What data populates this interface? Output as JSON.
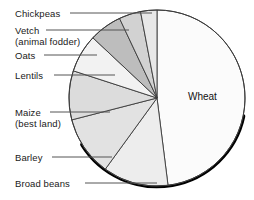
{
  "chart_data": {
    "type": "pie",
    "title": "",
    "subtitle": "",
    "xlabel": "",
    "ylabel": "",
    "legend_position": "callout-labels-left",
    "grid": false,
    "units": "share of cultivated land",
    "center": {
      "x": 157,
      "y": 98
    },
    "radius": 88,
    "start_angle_deg": -90,
    "direction": "clockwise",
    "categories": [
      "Wheat",
      "Broad beans",
      "Barley",
      "Maize (best land)",
      "Lentils",
      "Oats",
      "Vetch (animal fodder)",
      "Chickpeas"
    ],
    "values": [
      48,
      12,
      11,
      9,
      7,
      6,
      4,
      3
    ],
    "slices": [
      {
        "label": "Wheat",
        "label_line1": "Wheat",
        "label_line2": "",
        "value": 48,
        "start_deg": -90,
        "end_deg": 82.8,
        "fill": "#fbfbfb",
        "stroke": "#3a3a3a",
        "callout": false
      },
      {
        "label": "Broad beans",
        "label_line1": "Broad beans",
        "label_line2": "",
        "value": 12,
        "start_deg": 82.8,
        "end_deg": 126,
        "fill": "#ededed",
        "stroke": "#3a3a3a",
        "callout": true
      },
      {
        "label": "Barley",
        "label_line1": "Barley",
        "label_line2": "",
        "value": 11,
        "start_deg": 126,
        "end_deg": 165.6,
        "fill": "#e2e2e2",
        "stroke": "#3a3a3a",
        "callout": true
      },
      {
        "label": "Maize (best land)",
        "label_line1": "Maize",
        "label_line2": "(best land)",
        "value": 9,
        "start_deg": 165.6,
        "end_deg": 198,
        "fill": "#dcdcdc",
        "stroke": "#3a3a3a",
        "callout": true
      },
      {
        "label": "Lentils",
        "label_line1": "Lentils",
        "label_line2": "",
        "value": 7,
        "start_deg": 198,
        "end_deg": 223.2,
        "fill": "#f2f2f2",
        "stroke": "#3a3a3a",
        "callout": true
      },
      {
        "label": "Oats",
        "label_line1": "Oats",
        "label_line2": "",
        "value": 6,
        "start_deg": 223.2,
        "end_deg": 244.8,
        "fill": "#bdbdbd",
        "stroke": "#3a3a3a",
        "callout": true
      },
      {
        "label": "Vetch (animal fodder)",
        "label_line1": "Vetch",
        "label_line2": "(animal fodder)",
        "value": 4,
        "start_deg": 244.8,
        "end_deg": 259.2,
        "fill": "#d2d2d2",
        "stroke": "#3a3a3a",
        "callout": true
      },
      {
        "label": "Chickpeas",
        "label_line1": "Chickpeas",
        "label_line2": "",
        "value": 3,
        "start_deg": 259.2,
        "end_deg": 270,
        "fill": "#e8e8e8",
        "stroke": "#3a3a3a",
        "callout": true
      }
    ],
    "shadow": {
      "color": "#000000",
      "description": "thick dark arc along lower-right rim"
    }
  },
  "labels": {
    "chickpeas": "Chickpeas",
    "vetch_line1": "Vetch",
    "vetch_line2": "(animal fodder)",
    "oats": "Oats",
    "lentils": "Lentils",
    "maize_line1": "Maize",
    "maize_line2": "(best land)",
    "barley": "Barley",
    "broad_beans": "Broad beans",
    "wheat": "Wheat"
  },
  "colors": {
    "background": "#ffffff",
    "outline": "#3a3a3a",
    "text": "#1a1a1a",
    "leader_line": "#555555",
    "shadow": "#000000"
  }
}
